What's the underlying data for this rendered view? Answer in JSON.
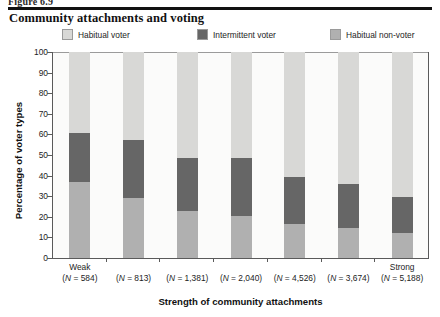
{
  "figure": {
    "label": "Figure 6.9",
    "title": "Community attachments and voting"
  },
  "legend": {
    "position": "top",
    "items": [
      {
        "label": "Habitual voter",
        "color": "#d8d8d6",
        "key": "habitual_voter"
      },
      {
        "label": "Intermittent voter",
        "color": "#666666",
        "key": "intermittent_voter"
      },
      {
        "label": "Habitual non-voter",
        "color": "#b0b0b0",
        "key": "habitual_non_voter"
      }
    ]
  },
  "axes": {
    "ylabel": "Percentage of voter types",
    "xlabel": "Strength of community attachments",
    "yticks": [
      0,
      10,
      20,
      30,
      40,
      50,
      60,
      70,
      80,
      90,
      100
    ],
    "ytick_labels": [
      "0",
      "10",
      "20",
      "30",
      "40",
      "50",
      "60",
      "70",
      "80",
      "90",
      "100"
    ],
    "ylim": [
      0,
      100
    ],
    "grid": false,
    "x_anchor_first": "Weak",
    "x_anchor_last": "Strong"
  },
  "chart_data": {
    "type": "bar",
    "subtype": "stacked-percentage",
    "title": "Community attachments and voting",
    "xlabel": "Strength of community attachments",
    "ylabel": "Percentage of voter types",
    "ylim": [
      0,
      100
    ],
    "grid": false,
    "legend_position": "top",
    "categories": [
      "(N = 584)",
      "(N = 813)",
      "(N = 1,381)",
      "(N = 2,040)",
      "(N = 4,526)",
      "(N = 3,674)",
      "(N = 5,188)"
    ],
    "category_n_values": [
      584,
      813,
      1381,
      2040,
      4526,
      3674,
      5188
    ],
    "category_anchors": [
      "Weak",
      "",
      "",
      "",
      "",
      "",
      "Strong"
    ],
    "series": [
      {
        "name": "Habitual non-voter",
        "color": "#b0b0b0",
        "values": [
          37,
          29,
          23,
          20.5,
          16.5,
          14.5,
          12
        ]
      },
      {
        "name": "Intermittent voter",
        "color": "#666666",
        "values": [
          23.5,
          28.5,
          25.5,
          28,
          23,
          21.5,
          17.5
        ]
      },
      {
        "name": "Habitual voter",
        "color": "#d8d8d6",
        "values": [
          39.5,
          42.5,
          51.5,
          51.5,
          60.5,
          64,
          70.5
        ]
      }
    ],
    "cumulative_boundaries": [
      [
        37,
        60.5
      ],
      [
        29,
        57.5
      ],
      [
        23,
        48.5
      ],
      [
        20.5,
        48.5
      ],
      [
        16.5,
        39.5
      ],
      [
        14.5,
        36
      ],
      [
        12,
        29.5
      ]
    ]
  }
}
